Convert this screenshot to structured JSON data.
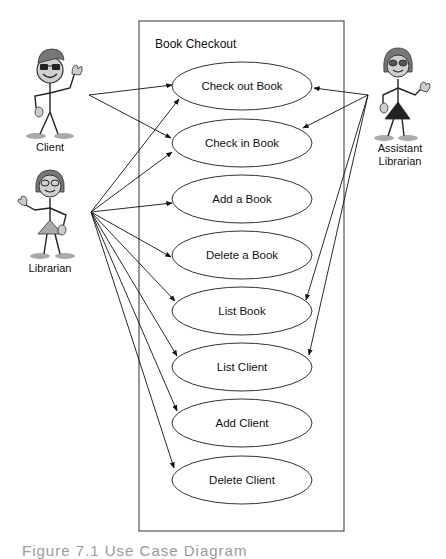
{
  "system": {
    "title": "Book Checkout",
    "border_color": "#555555"
  },
  "actors": [
    {
      "id": "client",
      "label": "Client"
    },
    {
      "id": "librarian",
      "label": "Librarian"
    },
    {
      "id": "assistant_librarian",
      "label_line1": "Assistant",
      "label_line2": "Librarian"
    }
  ],
  "use_cases": [
    {
      "label": "Check out Book"
    },
    {
      "label": "Check in Book"
    },
    {
      "label": "Add a Book"
    },
    {
      "label": "Delete a Book"
    },
    {
      "label": "List Book"
    },
    {
      "label": "List Client"
    },
    {
      "label": "Add Client"
    },
    {
      "label": "Delete Client"
    }
  ],
  "associations": {
    "client": [
      "Check out Book",
      "Check in Book"
    ],
    "librarian": [
      "Check out Book",
      "Check in Book",
      "Add a Book",
      "Delete a Book",
      "List Book",
      "List Client",
      "Add Client",
      "Delete Client"
    ],
    "assistant_librarian": [
      "Check out Book",
      "Check in Book",
      "List Book",
      "List Client"
    ]
  },
  "caption": "Figure 7.1 Use Case Diagram"
}
